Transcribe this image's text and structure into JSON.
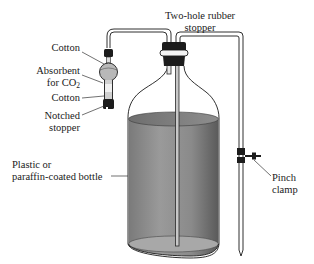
{
  "diagram": {
    "type": "apparatus",
    "labels": {
      "stopper_line1": "Two-hole rubber",
      "stopper_line2": "stopper",
      "cotton_top": "Cotton",
      "absorbent_line1": "Absorbent",
      "absorbent_line2_prefix": "for CO",
      "absorbent_line2_sub": "2",
      "cotton_bottom": "Cotton",
      "notched_line1": "Notched",
      "notched_line2": "stopper",
      "bottle_line1": "Plastic or",
      "bottle_line2": "paraffin-coated bottle",
      "clamp_line1": "Pinch",
      "clamp_line2": "clamp"
    },
    "components": [
      "two-hole-rubber-stopper",
      "co2-absorbent-tube",
      "cotton-plug-top",
      "cotton-plug-bottom",
      "notched-stopper",
      "bottle",
      "liquid",
      "inlet-tube",
      "siphon-tube",
      "pinch-clamp"
    ],
    "colors": {
      "line": "#1a1a1a",
      "liquid_dark": "#6a6a6a",
      "liquid_light": "#b5b5b5",
      "stopper": "#1c1c1c"
    }
  }
}
